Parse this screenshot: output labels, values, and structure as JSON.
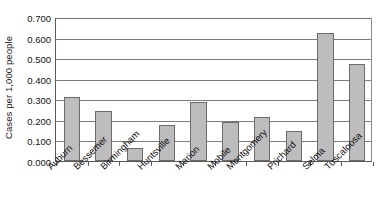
{
  "chart_data": {
    "type": "bar",
    "title": "",
    "xlabel": "",
    "ylabel": "Cases per 1,000 people",
    "ylim": [
      0.0,
      0.7
    ],
    "ytick_labels": [
      "0.700",
      "0.600",
      "0.500",
      "0.400",
      "0.300",
      "0.200",
      "0.100",
      "0.000"
    ],
    "ytick_values": [
      0.7,
      0.6,
      0.5,
      0.4,
      0.3,
      0.2,
      0.1,
      0.0
    ],
    "grid": "horizontal",
    "legend": "none",
    "bar_fill_color": "#bdbdbd",
    "bar_edge_color": "#6b6b6b",
    "axis_color": "#5a5a5a",
    "categories": [
      "Auburn",
      "Bessemer",
      "Birmingham",
      "Huntsville",
      "Marion",
      "Mobile",
      "Montgomery",
      "Prichard",
      "Selma",
      "Tuscaloosa"
    ],
    "values": [
      0.31,
      0.245,
      0.065,
      0.175,
      0.285,
      0.19,
      0.215,
      0.145,
      0.62,
      0.47
    ]
  }
}
